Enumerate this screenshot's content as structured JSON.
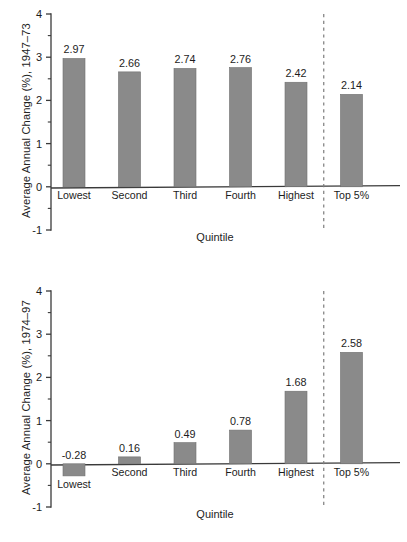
{
  "figure": {
    "bar_color": "#8a8a8a",
    "bar_edge_color": "#6f6f6f",
    "axis_color": "#3a3a3a",
    "divider_color": "#7d7d7d"
  },
  "chart_data": [
    {
      "type": "bar",
      "panel": "top",
      "title": "",
      "categories": [
        "Lowest",
        "Second",
        "Third",
        "Fourth",
        "Highest",
        "Top 5%"
      ],
      "values": [
        2.97,
        2.66,
        2.74,
        2.76,
        2.42,
        2.14
      ],
      "value_labels": [
        "2.97",
        "2.66",
        "2.74",
        "2.76",
        "2.42",
        "2.14"
      ],
      "xlabel": "Quintile",
      "ylabel": "Average Annual Change (%), 1947–73",
      "ylim": [
        -1,
        4
      ],
      "ytick_labels": [
        "4",
        "3",
        "2",
        "1",
        "0",
        "-1"
      ],
      "ytick_values": [
        4,
        3,
        2,
        1,
        0,
        -1
      ],
      "minor_tick_step": 0.5,
      "grid": false,
      "legend": "none",
      "divider_after_category": "Highest",
      "divider_style": "dashed"
    },
    {
      "type": "bar",
      "panel": "bottom",
      "title": "",
      "categories": [
        "Lowest",
        "Second",
        "Third",
        "Fourth",
        "Highest",
        "Top 5%"
      ],
      "values": [
        -0.28,
        0.16,
        0.49,
        0.78,
        1.68,
        2.58
      ],
      "value_labels": [
        "-0.28",
        "0.16",
        "0.49",
        "0.78",
        "1.68",
        "2.58"
      ],
      "xlabel": "Quintile",
      "ylabel": "Average Annual Change (%), 1974–97",
      "ylim": [
        -1,
        4
      ],
      "ytick_labels": [
        "4",
        "3",
        "2",
        "1",
        "0",
        "-1"
      ],
      "ytick_values": [
        4,
        3,
        2,
        1,
        0,
        -1
      ],
      "minor_tick_step": 0.5,
      "grid": false,
      "legend": "none",
      "divider_after_category": "Highest",
      "divider_style": "dashed"
    }
  ]
}
